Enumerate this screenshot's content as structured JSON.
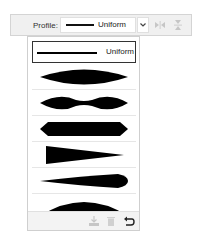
{
  "toolbar": {
    "profile_label": "Profile:",
    "selected_profile": "Uniform",
    "dropdown_chevron": "⌄",
    "flip_along_icon": "flip-horizontal-icon",
    "flip_across_icon": "flip-vertical-icon",
    "flip_buttons_enabled": false
  },
  "dropdown": {
    "items": [
      {
        "name": "Uniform",
        "label": "Uniform",
        "shape": "line",
        "selected": true
      },
      {
        "name": "Width Profile 1",
        "shape": "ellipse",
        "selected": false
      },
      {
        "name": "Width Profile 2",
        "shape": "double-bulge",
        "selected": false
      },
      {
        "name": "Width Profile 3",
        "shape": "hexagon",
        "selected": false
      },
      {
        "name": "Width Profile 4",
        "shape": "triangle-taper",
        "selected": false
      },
      {
        "name": "Width Profile 5",
        "shape": "asymmetric-leaf",
        "selected": false
      },
      {
        "name": "Width Profile 6",
        "shape": "half-dome",
        "selected": false
      }
    ],
    "footer": {
      "add_icon": "add-to-profile-icon",
      "delete_icon": "delete-profile-icon",
      "reset_icon": "reset-profiles-icon",
      "add_enabled": false,
      "delete_enabled": false,
      "reset_enabled": true
    }
  },
  "colors": {
    "toolbar_bg": "#f0f0f0",
    "shape_fill": "#000000",
    "disabled_icon": "#c6c6c6"
  }
}
